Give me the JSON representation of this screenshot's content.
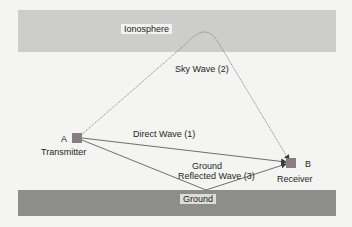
{
  "diagram": {
    "layers": {
      "ionosphere": {
        "label": "Ionosphere",
        "color": "#cdcdcb"
      },
      "ground": {
        "label": "Ground",
        "color": "#8d8d8b"
      }
    },
    "nodes": {
      "transmitter": {
        "id": "A",
        "label": "Transmitter",
        "color": "#877d82"
      },
      "receiver": {
        "id": "B",
        "label": "Receiver",
        "color": "#877d82"
      }
    },
    "paths": {
      "direct": {
        "label": "Direct Wave (1)"
      },
      "sky": {
        "label": "Sky Wave (2)"
      },
      "ground_reflected": {
        "line1": "Ground",
        "line2": "Reflected Wave (3)"
      }
    },
    "line_color": "#6e6e6e"
  }
}
